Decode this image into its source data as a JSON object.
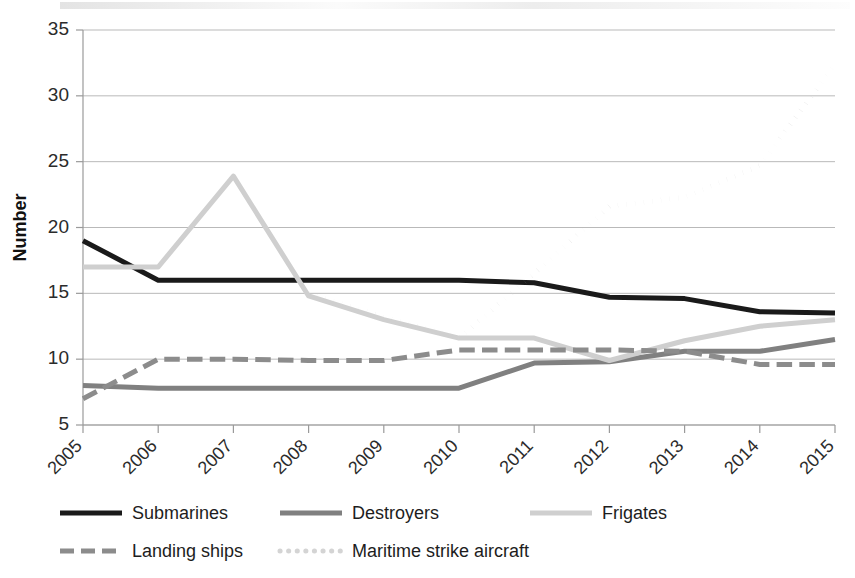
{
  "chart_data": {
    "type": "line",
    "title": "",
    "subtitle": "",
    "xlabel": "",
    "ylabel": "Number",
    "x": [
      "2005",
      "2006",
      "2007",
      "2008",
      "2009",
      "2010",
      "2011",
      "2012",
      "2013",
      "2014",
      "2015"
    ],
    "categories": [
      "2005",
      "2006",
      "2007",
      "2008",
      "2009",
      "2010",
      "2011",
      "2012",
      "2013",
      "2014",
      "2015"
    ],
    "ylim": [
      5,
      35
    ],
    "yticks": [
      5,
      10,
      15,
      20,
      25,
      30,
      35
    ],
    "ytick_labels": [
      "5",
      "10",
      "15",
      "20",
      "25",
      "30",
      "35"
    ],
    "grid": true,
    "legend_position": "bottom",
    "series": [
      {
        "name": "Submarines",
        "style": "solid",
        "color": "#1a1a1a",
        "width": 5,
        "values": [
          19,
          16,
          16,
          16,
          16,
          16,
          15.8,
          14.7,
          14.6,
          13.6,
          13.5
        ]
      },
      {
        "name": "Destroyers",
        "style": "solid",
        "color": "#808080",
        "width": 5,
        "values": [
          8,
          7.8,
          7.8,
          7.8,
          7.8,
          7.8,
          9.7,
          9.8,
          10.6,
          10.6,
          11.5
        ]
      },
      {
        "name": "Frigates",
        "style": "solid",
        "color": "#cfcfcf",
        "width": 5,
        "values": [
          17,
          17,
          23.9,
          14.8,
          13,
          11.6,
          11.6,
          9.9,
          11.4,
          12.5,
          13
        ]
      },
      {
        "name": "Landing ships",
        "style": "dashed",
        "color": "#8c8c8c",
        "width": 5,
        "values": [
          7,
          10,
          10,
          9.9,
          9.9,
          10.7,
          10.7,
          10.7,
          10.6,
          9.6,
          9.6
        ]
      },
      {
        "name": "Maritime strike aircraft",
        "style": "dotted",
        "color": "#d4d4d4",
        "width": 5,
        "values": [
          null,
          null,
          null,
          15,
          13.2,
          11.6,
          16.5,
          21.6,
          22.3,
          24.7,
          32.4
        ]
      }
    ]
  },
  "axes": {
    "y_title": "Number"
  },
  "legend": {
    "items": [
      {
        "label": "Submarines",
        "swatch": "legend-swatch-solid-black"
      },
      {
        "label": "Destroyers",
        "swatch": "legend-swatch-solid-gray"
      },
      {
        "label": "Frigates",
        "swatch": "legend-swatch-solid-lightgray"
      },
      {
        "label": "Landing ships",
        "swatch": "legend-swatch-dashed-gray"
      },
      {
        "label": "Maritime strike aircraft",
        "swatch": "legend-swatch-dotted-lightgray"
      }
    ]
  },
  "colors": {
    "submarines": "#1a1a1a",
    "destroyers": "#808080",
    "frigates": "#cfcfcf",
    "landing_ships": "#8c8c8c",
    "maritime_strike_aircraft": "#d4d4d4",
    "gridline": "#b9b9b9",
    "background": "#ffffff"
  }
}
